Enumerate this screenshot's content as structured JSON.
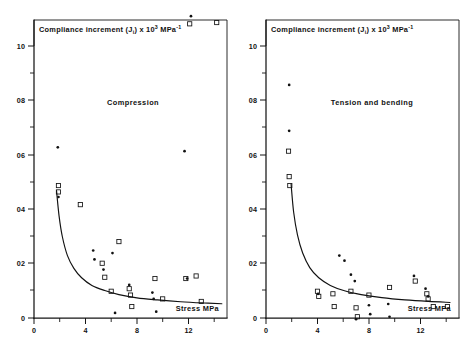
{
  "figure": {
    "background_color": "#ffffff",
    "ink_color": "#111111"
  },
  "chart_data": [
    {
      "type": "scatter",
      "panel_id": "left",
      "title": "Compliance increment (Ji) x 103 MPa-1",
      "title_parts": {
        "lead": "Compliance increment (J",
        "subscript": "i",
        "mid": ") x 10",
        "superscript": "3",
        "unit": " MPa",
        "unit_superscript": "-1"
      },
      "annotation": "Compression",
      "xlabel": "Stress  MPa",
      "ylabel": "",
      "xlim": [
        0,
        15
      ],
      "ylim": [
        0,
        1.17
      ],
      "xticks": [
        0,
        4,
        8,
        12
      ],
      "xtick_labels": [
        "0",
        "4",
        "8",
        "12"
      ],
      "xticks_minor": [
        2,
        6,
        10,
        14
      ],
      "yticks": [
        0,
        0.2,
        0.4,
        0.6,
        0.8,
        1.0
      ],
      "ytick_labels": [
        "0",
        "02",
        "04",
        "06",
        "08",
        "10"
      ],
      "yticks_minor": [
        0.1,
        0.3,
        0.5,
        0.7,
        0.9,
        1.1
      ],
      "grid": false,
      "legend": "none",
      "series": [
        {
          "name": "open-square",
          "marker": "square",
          "points": [
            [
              1.9,
              0.495
            ],
            [
              1.9,
              0.52
            ],
            [
              3.6,
              0.445
            ],
            [
              5.3,
              0.215
            ],
            [
              5.5,
              0.16
            ],
            [
              6.0,
              0.105
            ],
            [
              6.6,
              0.3
            ],
            [
              7.4,
              0.115
            ],
            [
              7.5,
              0.09
            ],
            [
              7.6,
              0.045
            ],
            [
              9.4,
              0.155
            ],
            [
              10.0,
              0.075
            ],
            [
              11.8,
              0.155
            ],
            [
              12.6,
              0.165
            ],
            [
              13.0,
              0.065
            ],
            [
              14.2,
              1.16
            ],
            [
              12.1,
              1.155
            ]
          ]
        },
        {
          "name": "filled-dot",
          "marker": "dot",
          "points": [
            [
              1.85,
              0.67
            ],
            [
              1.9,
              0.475
            ],
            [
              4.6,
              0.265
            ],
            [
              4.7,
              0.23
            ],
            [
              5.4,
              0.19
            ],
            [
              6.1,
              0.255
            ],
            [
              6.3,
              0.02
            ],
            [
              7.4,
              0.13
            ],
            [
              9.2,
              0.1
            ],
            [
              9.3,
              0.075
            ],
            [
              9.5,
              0.025
            ],
            [
              11.7,
              0.655
            ],
            [
              11.9,
              0.155
            ],
            [
              12.2,
              1.185
            ]
          ]
        }
      ],
      "fit_curve": {
        "description": "hyperbolic decay fit",
        "points": [
          [
            1.75,
            0.5
          ],
          [
            1.95,
            0.4
          ],
          [
            2.2,
            0.32
          ],
          [
            2.6,
            0.245
          ],
          [
            3.1,
            0.195
          ],
          [
            3.7,
            0.158
          ],
          [
            4.5,
            0.128
          ],
          [
            5.5,
            0.108
          ],
          [
            6.6,
            0.092
          ],
          [
            8.0,
            0.079
          ],
          [
            9.6,
            0.071
          ],
          [
            11.4,
            0.064
          ],
          [
            13.2,
            0.059
          ],
          [
            14.6,
            0.056
          ]
        ]
      }
    },
    {
      "type": "scatter",
      "panel_id": "right",
      "title": "Compliance increment (Ji) x 103 MPa-1",
      "title_parts": {
        "lead": "Compliance increment (J",
        "subscript": "i",
        "mid": ") x 10",
        "superscript": "3",
        "unit": " MPa",
        "unit_superscript": "-1"
      },
      "annotation": "Tension and bending",
      "xlabel": "Stress  MPa",
      "ylabel": "",
      "xlim": [
        0,
        15
      ],
      "ylim": [
        0,
        1.17
      ],
      "xticks": [
        0,
        4,
        8,
        12
      ],
      "xtick_labels": [
        "0",
        "4",
        "8",
        "12"
      ],
      "xticks_minor": [
        2,
        6,
        10,
        14
      ],
      "yticks": [
        0,
        0.2,
        0.4,
        0.6,
        0.8,
        1.0
      ],
      "ytick_labels": [
        "0",
        "02",
        "04",
        "06",
        "08",
        "10"
      ],
      "yticks_minor": [
        0.1,
        0.3,
        0.5,
        0.7,
        0.9,
        1.1
      ],
      "grid": false,
      "legend": "none",
      "series": [
        {
          "name": "open-square",
          "marker": "square",
          "points": [
            [
              1.75,
              0.655
            ],
            [
              1.8,
              0.555
            ],
            [
              1.85,
              0.52
            ],
            [
              4.0,
              0.105
            ],
            [
              4.1,
              0.085
            ],
            [
              5.2,
              0.095
            ],
            [
              5.3,
              0.045
            ],
            [
              6.6,
              0.105
            ],
            [
              7.0,
              0.04
            ],
            [
              7.1,
              0.005
            ],
            [
              8.0,
              0.09
            ],
            [
              9.6,
              0.12
            ],
            [
              11.6,
              0.145
            ],
            [
              12.5,
              0.095
            ],
            [
              12.6,
              0.075
            ],
            [
              13.0,
              0.045
            ],
            [
              14.1,
              0.045
            ]
          ]
        },
        {
          "name": "filled-dot",
          "marker": "dot",
          "points": [
            [
              1.8,
              0.915
            ],
            [
              1.8,
              0.735
            ],
            [
              4.05,
              0.095
            ],
            [
              5.7,
              0.245
            ],
            [
              6.1,
              0.225
            ],
            [
              6.6,
              0.17
            ],
            [
              6.9,
              0.145
            ],
            [
              7.0,
              -0.005
            ],
            [
              8.0,
              0.05
            ],
            [
              8.1,
              0.015
            ],
            [
              9.5,
              0.055
            ],
            [
              9.6,
              0.005
            ],
            [
              11.5,
              0.165
            ],
            [
              12.4,
              0.115
            ],
            [
              12.6,
              0.085
            ]
          ]
        }
      ],
      "fit_curve": {
        "description": "hyperbolic decay fit",
        "points": [
          [
            1.95,
            0.525
          ],
          [
            2.15,
            0.415
          ],
          [
            2.45,
            0.325
          ],
          [
            2.85,
            0.255
          ],
          [
            3.4,
            0.198
          ],
          [
            4.1,
            0.158
          ],
          [
            5.0,
            0.128
          ],
          [
            6.1,
            0.107
          ],
          [
            7.4,
            0.092
          ],
          [
            9.0,
            0.08
          ],
          [
            10.8,
            0.071
          ],
          [
            12.6,
            0.065
          ],
          [
            14.3,
            0.061
          ]
        ]
      }
    }
  ]
}
